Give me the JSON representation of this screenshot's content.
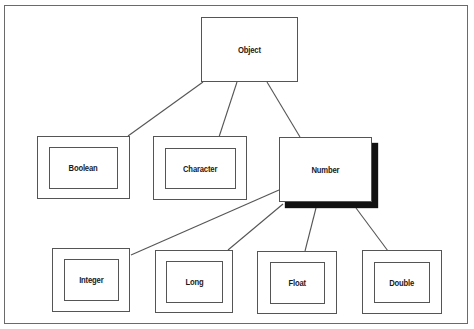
{
  "diagram": {
    "root": {
      "label": "Object"
    },
    "level1": [
      {
        "label": "Boolean"
      },
      {
        "label": "Character"
      },
      {
        "label": "Number"
      }
    ],
    "level2": [
      {
        "label": "Integer"
      },
      {
        "label": "Long"
      },
      {
        "label": "Float"
      },
      {
        "label": "Double"
      }
    ],
    "edges": [
      {
        "from": "Object",
        "to": "Boolean"
      },
      {
        "from": "Object",
        "to": "Character"
      },
      {
        "from": "Object",
        "to": "Number"
      },
      {
        "from": "Number",
        "to": "Integer"
      },
      {
        "from": "Number",
        "to": "Long"
      },
      {
        "from": "Number",
        "to": "Float"
      },
      {
        "from": "Number",
        "to": "Double"
      }
    ],
    "colors": {
      "line": "#555555",
      "frame": "#6a6a6a",
      "shadow": "#111111",
      "background": "#ffffff"
    }
  }
}
